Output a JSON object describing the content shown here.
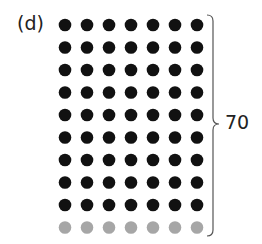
{
  "figure": {
    "label": "(d)",
    "total_label": "70",
    "grid": {
      "rows": 10,
      "columns": 7,
      "row_colors": [
        "#111111",
        "#111111",
        "#111111",
        "#111111",
        "#111111",
        "#111111",
        "#111111",
        "#111111",
        "#111111",
        "#a6a6a6"
      ],
      "dark_color": "#111111",
      "light_color": "#a6a6a6",
      "dark_rows": 9,
      "light_rows": 1
    },
    "brace": {
      "color": "#555555"
    }
  }
}
